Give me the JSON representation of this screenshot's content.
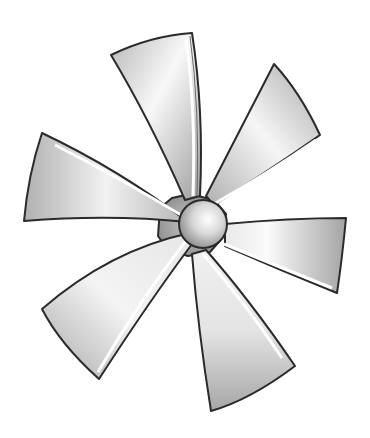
{
  "image": {
    "subject": "six-bladed propeller fan illustration",
    "blade_count": 6,
    "colors": {
      "background": "#ffffff",
      "outline": "#2a2a2a",
      "blade_light": "#fafafa",
      "blade_mid": "#d4d4d4",
      "blade_dark": "#9a9a9a",
      "hub_light": "#f4f4f4",
      "hub_dark": "#8a8a8a"
    }
  }
}
